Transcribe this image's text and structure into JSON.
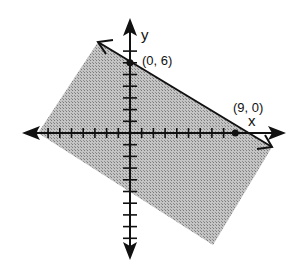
{
  "figure": {
    "axes": {
      "x_label": "x",
      "y_label": "y",
      "origin_px": [
        130,
        133
      ],
      "unit_px": 11.7,
      "x_ticks_left": 8,
      "x_ticks_right": 8,
      "y_ticks_up": 6,
      "y_ticks_down": 9
    },
    "points": [
      {
        "label": "(0, 6)",
        "x": 0,
        "y": 6
      },
      {
        "label": "(9, 0)",
        "x": 9,
        "y": 0
      }
    ],
    "boundary_line": "through (0, 6) and (9, 0)",
    "shaded_region": "below the line",
    "colors": {
      "shade": "#b0b0b0",
      "axis": "#111111",
      "line": "#111111"
    }
  }
}
